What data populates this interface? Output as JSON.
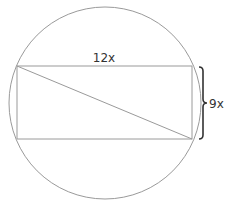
{
  "diagram": {
    "type": "rectangle-inscribed-in-circle",
    "labels": {
      "width": "12x",
      "height": "9x"
    },
    "colors": {
      "stroke": "#9a9a9a",
      "text": "#333333",
      "brace": "#333333",
      "background": "#ffffff"
    }
  }
}
